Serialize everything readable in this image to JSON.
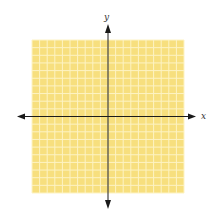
{
  "chart_data": {
    "type": "coordinate-grid",
    "title": "",
    "xlabel": "x",
    "ylabel": "y",
    "xlim": [
      -10,
      10
    ],
    "ylim": [
      -10,
      10
    ],
    "grid": true,
    "grid_step": 1,
    "series": [],
    "colors": {
      "grid_fill": "#f7df7e",
      "grid_line": "#fdf3c4",
      "axis": "#1a1a1a"
    }
  }
}
